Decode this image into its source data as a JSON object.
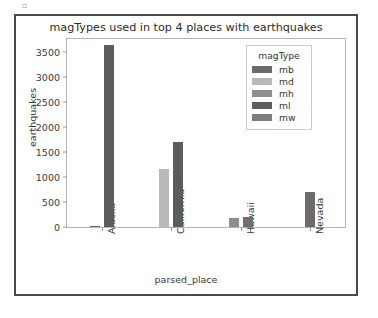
{
  "artifact": {
    "glyph": "▫"
  },
  "chart_data": {
    "type": "bar",
    "title": "magTypes used in top 4 places with earthquakes",
    "xlabel": "parsed_place",
    "ylabel": "earthquakes",
    "categories": [
      "Alaska",
      "California",
      "Hawaii",
      "Nevada"
    ],
    "ylim": [
      0,
      3750
    ],
    "yticks": [
      0,
      500,
      1000,
      1500,
      2000,
      2500,
      3000,
      3500
    ],
    "ytick_labels": [
      "0",
      "500",
      "1000",
      "1500",
      "2000",
      "2500",
      "3000",
      "3500"
    ],
    "grid": false,
    "legend_position": "upper right",
    "legend_title": "magType",
    "series": [
      {
        "name": "mb",
        "color": "#6b6b6b",
        "values": [
          14,
          0,
          0,
          0
        ]
      },
      {
        "name": "md",
        "color": "#b9b9b9",
        "values": [
          0,
          1158,
          0,
          0
        ]
      },
      {
        "name": "mh",
        "color": "#8e8e8e",
        "values": [
          0,
          0,
          182,
          0
        ]
      },
      {
        "name": "ml",
        "color": "#5c5c5c",
        "values": [
          3630,
          1704,
          209,
          689
        ]
      },
      {
        "name": "mw",
        "color": "#7d7d7d",
        "values": [
          0,
          0,
          0,
          0
        ]
      }
    ],
    "bars": [
      {
        "category": "Alaska",
        "series": "mb",
        "value": 14,
        "color": "#6b6b6b"
      },
      {
        "category": "Alaska",
        "series": "ml",
        "value": 3630,
        "color": "#5c5c5c"
      },
      {
        "category": "California",
        "series": "md",
        "value": 1158,
        "color": "#b9b9b9"
      },
      {
        "category": "California",
        "series": "ml",
        "value": 1704,
        "color": "#5c5c5c"
      },
      {
        "category": "Hawaii",
        "series": "mh",
        "value": 182,
        "color": "#8e8e8e"
      },
      {
        "category": "Hawaii",
        "series": "ml",
        "value": 209,
        "color": "#6f6f6f"
      },
      {
        "category": "Nevada",
        "series": "ml",
        "value": 689,
        "color": "#6b6b6b"
      }
    ]
  }
}
